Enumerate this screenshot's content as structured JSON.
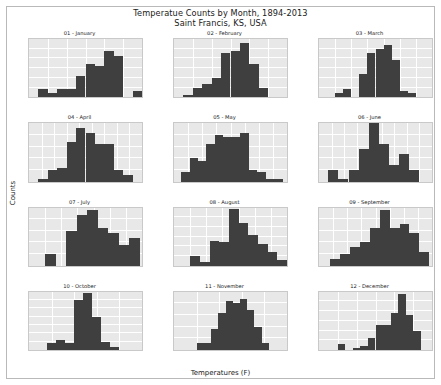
{
  "figure": {
    "title_line1": "Temperatue Counts by Month, 1894-2013",
    "title_line2": "Saint Francis, KS, USA",
    "xlabel": "Temperatures (F)",
    "ylabel": "Counts",
    "bar_color": "#3f3f3f",
    "axes_facecolor": "#e8e8e8",
    "grid_color": "#ffffff",
    "background": "#ffffff"
  },
  "chart_data": [
    {
      "type": "bar",
      "title": "01 - January",
      "xlabel": "",
      "ylabel": "",
      "grid": true,
      "xlim": [
        10,
        40
      ],
      "ylim": [
        0,
        30
      ],
      "xticks": [
        10,
        15,
        20,
        25,
        30,
        35,
        40
      ],
      "yticks": [
        0,
        5,
        10,
        15,
        20,
        25,
        30
      ],
      "bin_width": 2.5,
      "bin_starts": [
        12.5,
        15.0,
        17.5,
        20.0,
        22.5,
        25.0,
        27.5,
        30.0,
        32.5,
        35.0,
        37.5
      ],
      "values": [
        4,
        2,
        4,
        4,
        11,
        17,
        16,
        24,
        21,
        0,
        3
      ]
    },
    {
      "type": "bar",
      "title": "02 - February",
      "xlabel": "",
      "ylabel": "",
      "grid": true,
      "xlim": [
        15,
        45
      ],
      "ylim": [
        0,
        30
      ],
      "xticks": [
        15,
        20,
        25,
        30,
        35,
        40,
        45
      ],
      "yticks": [
        0,
        5,
        10,
        15,
        20,
        25,
        30
      ],
      "bin_width": 2.5,
      "bin_starts": [
        17.5,
        20.0,
        22.5,
        25.0,
        27.5,
        30.0,
        32.5,
        35.0,
        37.5
      ],
      "values": [
        1,
        5,
        7,
        10,
        23,
        24,
        28,
        17,
        5
      ]
    },
    {
      "type": "bar",
      "title": "03 - March",
      "xlabel": "",
      "ylabel": "",
      "grid": true,
      "xlim": [
        20,
        55
      ],
      "ylim": [
        0,
        30
      ],
      "xticks": [
        20,
        25,
        30,
        35,
        40,
        45,
        50,
        55
      ],
      "yticks": [
        0,
        5,
        10,
        15,
        20,
        25,
        30
      ],
      "bin_width": 2.5,
      "bin_starts": [
        25.0,
        27.5,
        32.5,
        35.0,
        37.5,
        40.0,
        42.5,
        45.0,
        47.5
      ],
      "values": [
        2,
        4,
        12,
        23,
        25,
        27,
        19,
        3,
        2
      ]
    },
    {
      "type": "bar",
      "title": "04 - April",
      "xlabel": "",
      "ylabel": "",
      "grid": true,
      "xlim": [
        40,
        58
      ],
      "ylim": [
        0,
        25
      ],
      "xticks": [
        40,
        42,
        44,
        46,
        48,
        50,
        52,
        54,
        56,
        58
      ],
      "yticks": [
        0,
        5,
        10,
        15,
        20,
        25
      ],
      "bin_width": 1.5,
      "bin_starts": [
        41.5,
        43.0,
        44.5,
        46.0,
        47.5,
        49.0,
        50.5,
        52.0,
        53.5,
        55.0
      ],
      "values": [
        1,
        5,
        6,
        17,
        23,
        21,
        16,
        16,
        5,
        3
      ]
    },
    {
      "type": "bar",
      "title": "05 - May",
      "xlabel": "",
      "ylabel": "",
      "grid": true,
      "xlim": [
        52,
        68
      ],
      "ylim": [
        0,
        25
      ],
      "xticks": [
        52,
        54,
        56,
        58,
        60,
        62,
        64,
        66,
        68
      ],
      "yticks": [
        0,
        5,
        10,
        15,
        20,
        25
      ],
      "bin_width": 1.2,
      "bin_starts": [
        53.0,
        54.2,
        55.4,
        56.6,
        57.8,
        59.0,
        60.2,
        61.4,
        62.6,
        63.8,
        65.0,
        66.2
      ],
      "values": [
        4,
        10,
        9,
        16,
        20,
        19,
        19,
        21,
        5,
        4,
        1,
        1
      ]
    },
    {
      "type": "bar",
      "title": "06 - June",
      "xlabel": "",
      "ylabel": "",
      "grid": true,
      "xlim": [
        60,
        78
      ],
      "ylim": [
        0,
        25
      ],
      "xticks": [
        60,
        62,
        64,
        66,
        68,
        70,
        72,
        74,
        76,
        78
      ],
      "yticks": [
        0,
        5,
        10,
        15,
        20,
        25
      ],
      "bin_width": 1.6,
      "bin_starts": [
        61.5,
        63.1,
        64.7,
        66.3,
        67.9,
        69.5,
        71.1,
        72.7,
        74.3
      ],
      "values": [
        5,
        1,
        5,
        14,
        25,
        16,
        7,
        12,
        5
      ]
    },
    {
      "type": "bar",
      "title": "07 - July",
      "xlabel": "",
      "ylabel": "",
      "grid": true,
      "xlim": [
        68,
        82
      ],
      "ylim": [
        0,
        25
      ],
      "xticks": [
        68,
        70,
        72,
        74,
        76,
        78,
        80,
        82
      ],
      "yticks": [
        0,
        5,
        10,
        15,
        20,
        25
      ],
      "bin_width": 1.3,
      "bin_starts": [
        70.0,
        71.3,
        72.6,
        73.9,
        75.2,
        76.5,
        77.8,
        79.1,
        80.4
      ],
      "values": [
        5,
        0,
        15,
        22,
        24,
        16,
        14,
        9,
        12
      ]
    },
    {
      "type": "bar",
      "title": "08 - August",
      "xlabel": "",
      "ylabel": "",
      "grid": true,
      "xlim": [
        66,
        80
      ],
      "ylim": [
        0,
        30
      ],
      "xticks": [
        66,
        68,
        70,
        72,
        74,
        76,
        78,
        80
      ],
      "yticks": [
        0,
        5,
        10,
        15,
        20,
        25,
        30
      ],
      "bin_width": 1.2,
      "bin_starts": [
        68.0,
        69.2,
        70.4,
        71.6,
        72.8,
        74.0,
        75.2,
        76.4,
        77.6,
        78.8
      ],
      "values": [
        5,
        2,
        13,
        12,
        29,
        22,
        16,
        11,
        7,
        3
      ]
    },
    {
      "type": "bar",
      "title": "09 - September",
      "xlabel": "",
      "ylabel": "",
      "grid": true,
      "xlim": [
        56,
        72
      ],
      "ylim": [
        0,
        25
      ],
      "xticks": [
        56,
        58,
        60,
        62,
        64,
        66,
        68,
        70,
        72
      ],
      "yticks": [
        0,
        5,
        10,
        15,
        20,
        25
      ],
      "bin_width": 1.4,
      "bin_starts": [
        57.6,
        59.0,
        60.4,
        61.8,
        63.2,
        64.6,
        66.0,
        67.4,
        68.8,
        70.2
      ],
      "values": [
        3,
        5,
        8,
        10,
        16,
        24,
        16,
        18,
        14,
        6
      ]
    },
    {
      "type": "bar",
      "title": "10 - October",
      "xlabel": "",
      "ylabel": "",
      "grid": true,
      "xlim": [
        40,
        65
      ],
      "ylim": [
        0,
        35
      ],
      "xticks": [
        40,
        45,
        50,
        55,
        60,
        65
      ],
      "yticks": [
        0,
        5,
        10,
        15,
        20,
        25,
        30,
        35
      ],
      "bin_width": 2.0,
      "bin_starts": [
        44.0,
        46.0,
        48.0,
        50.0,
        52.0,
        54.0,
        56.0,
        58.0
      ],
      "values": [
        4,
        6,
        4,
        30,
        34,
        20,
        5,
        2
      ]
    },
    {
      "type": "bar",
      "title": "11 - November",
      "xlabel": "",
      "ylabel": "",
      "grid": true,
      "xlim": [
        25,
        50
      ],
      "ylim": [
        0,
        25
      ],
      "xticks": [
        25,
        30,
        35,
        40,
        45,
        50
      ],
      "yticks": [
        0,
        5,
        10,
        15,
        20,
        25
      ],
      "bin_width": 1.6,
      "bin_starts": [
        30.0,
        31.6,
        33.2,
        34.8,
        36.4,
        38.0,
        39.6,
        41.2,
        42.8,
        44.4
      ],
      "values": [
        3,
        3,
        9,
        16,
        21,
        20,
        22,
        17,
        10,
        3
      ]
    },
    {
      "type": "bar",
      "title": "12 - December",
      "xlabel": "",
      "ylabel": "",
      "grid": true,
      "xlim": [
        10,
        40
      ],
      "ylim": [
        0,
        30
      ],
      "xticks": [
        10,
        15,
        20,
        25,
        30,
        35,
        40
      ],
      "yticks": [
        0,
        5,
        10,
        15,
        20,
        25,
        30
      ],
      "bin_width": 2.0,
      "bin_starts": [
        15.0,
        17.0,
        19.0,
        21.0,
        23.0,
        25.0,
        27.0,
        29.0,
        31.0,
        33.0,
        35.0
      ],
      "values": [
        3,
        0,
        1,
        2,
        6,
        13,
        13,
        19,
        29,
        18,
        10
      ]
    }
  ]
}
